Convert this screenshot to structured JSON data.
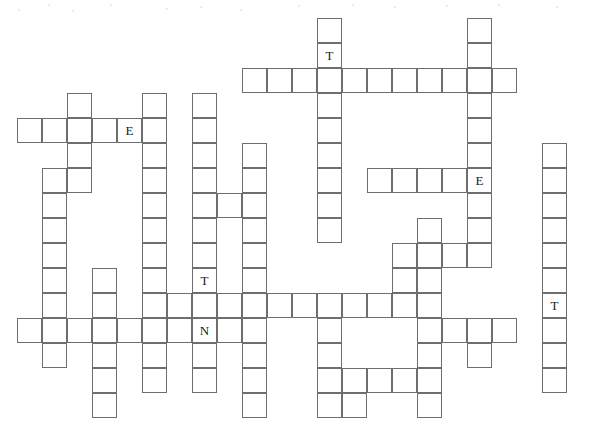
{
  "puzzle": {
    "kind": "crossword-grid",
    "title": "Crossword Puzzle Grid",
    "cell_size": 25,
    "origin_x": 17,
    "origin_y": 18,
    "grid_cols": 23,
    "grid_rows": 17,
    "border_color": "#6e6e6e",
    "cell_background": "#ffffff",
    "letter_color": "#1a1a1a",
    "page_background": "#ffffff",
    "letter_count": 5,
    "cell_count": 139,
    "given_letters": [
      {
        "row": 1,
        "col": 12,
        "letter": "T"
      },
      {
        "row": 4,
        "col": 4,
        "letter": "E"
      },
      {
        "row": 6,
        "col": 18,
        "letter": "E"
      },
      {
        "row": 10,
        "col": 7,
        "letter": "T"
      },
      {
        "row": 11,
        "col": 21,
        "letter": "T"
      },
      {
        "row": 12,
        "col": 7,
        "letter": "N"
      }
    ],
    "entries": [
      {
        "name": "across-1",
        "row": 2,
        "col": 9,
        "length": 11,
        "direction": "across"
      },
      {
        "name": "across-2",
        "row": 4,
        "col": 0,
        "length": 5,
        "direction": "across"
      },
      {
        "name": "across-3",
        "row": 6,
        "col": 14,
        "length": 5,
        "direction": "across"
      },
      {
        "name": "across-4",
        "row": 7,
        "col": 7,
        "length": 3,
        "direction": "across"
      },
      {
        "name": "across-5",
        "row": 9,
        "col": 15,
        "length": 4,
        "direction": "across"
      },
      {
        "name": "across-6",
        "row": 10,
        "col": 15,
        "length": 1,
        "direction": "across"
      },
      {
        "name": "across-7",
        "row": 11,
        "col": 5,
        "length": 12,
        "direction": "across"
      },
      {
        "name": "across-8",
        "row": 12,
        "col": 0,
        "length": 10,
        "direction": "across"
      },
      {
        "name": "across-9",
        "row": 12,
        "col": 16,
        "length": 4,
        "direction": "across"
      },
      {
        "name": "across-10",
        "row": 14,
        "col": 13,
        "length": 4,
        "direction": "across"
      },
      {
        "name": "down-1",
        "row": 0,
        "col": 12,
        "length": 9,
        "direction": "down"
      },
      {
        "name": "down-2",
        "row": 0,
        "col": 18,
        "length": 9,
        "direction": "down"
      },
      {
        "name": "down-3",
        "row": 3,
        "col": 2,
        "length": 5,
        "direction": "down"
      },
      {
        "name": "down-4",
        "row": 3,
        "col": 5,
        "length": 10,
        "direction": "down"
      },
      {
        "name": "down-5",
        "row": 3,
        "col": 7,
        "length": 11,
        "direction": "down"
      },
      {
        "name": "down-6",
        "row": 5,
        "col": 21,
        "length": 9,
        "direction": "down"
      },
      {
        "name": "down-7",
        "row": 5,
        "col": 9,
        "length": 10,
        "direction": "down"
      },
      {
        "name": "down-8",
        "row": 6,
        "col": 1,
        "length": 9,
        "direction": "down"
      },
      {
        "name": "down-9",
        "row": 8,
        "col": 16,
        "length": 8,
        "direction": "down"
      },
      {
        "name": "down-10",
        "row": 11,
        "col": 3,
        "length": 5,
        "direction": "down"
      }
    ],
    "cells": [
      [
        0,
        12
      ],
      [
        0,
        18
      ],
      [
        1,
        12
      ],
      [
        1,
        18
      ],
      [
        2,
        9
      ],
      [
        2,
        10
      ],
      [
        2,
        11
      ],
      [
        2,
        12
      ],
      [
        2,
        13
      ],
      [
        2,
        14
      ],
      [
        2,
        15
      ],
      [
        2,
        16
      ],
      [
        2,
        17
      ],
      [
        2,
        18
      ],
      [
        2,
        19
      ],
      [
        3,
        2
      ],
      [
        3,
        5
      ],
      [
        3,
        7
      ],
      [
        3,
        12
      ],
      [
        3,
        18
      ],
      [
        4,
        0
      ],
      [
        4,
        1
      ],
      [
        4,
        2
      ],
      [
        4,
        3
      ],
      [
        4,
        4
      ],
      [
        4,
        5
      ],
      [
        4,
        7
      ],
      [
        4,
        12
      ],
      [
        4,
        18
      ],
      [
        5,
        2
      ],
      [
        5,
        5
      ],
      [
        5,
        7
      ],
      [
        5,
        9
      ],
      [
        5,
        12
      ],
      [
        5,
        18
      ],
      [
        5,
        21
      ],
      [
        6,
        1
      ],
      [
        6,
        2
      ],
      [
        6,
        5
      ],
      [
        6,
        7
      ],
      [
        6,
        9
      ],
      [
        6,
        12
      ],
      [
        6,
        14
      ],
      [
        6,
        15
      ],
      [
        6,
        16
      ],
      [
        6,
        17
      ],
      [
        6,
        18
      ],
      [
        6,
        21
      ],
      [
        7,
        1
      ],
      [
        7,
        5
      ],
      [
        7,
        7
      ],
      [
        7,
        8
      ],
      [
        7,
        9
      ],
      [
        7,
        12
      ],
      [
        7,
        18
      ],
      [
        7,
        21
      ],
      [
        8,
        1
      ],
      [
        8,
        5
      ],
      [
        8,
        7
      ],
      [
        8,
        9
      ],
      [
        8,
        12
      ],
      [
        8,
        16
      ],
      [
        8,
        18
      ],
      [
        8,
        21
      ],
      [
        9,
        1
      ],
      [
        9,
        5
      ],
      [
        9,
        7
      ],
      [
        9,
        9
      ],
      [
        9,
        15
      ],
      [
        9,
        16
      ],
      [
        9,
        17
      ],
      [
        9,
        18
      ],
      [
        9,
        21
      ],
      [
        10,
        1
      ],
      [
        10,
        3
      ],
      [
        10,
        5
      ],
      [
        10,
        7
      ],
      [
        10,
        9
      ],
      [
        10,
        15
      ],
      [
        10,
        16
      ],
      [
        10,
        21
      ],
      [
        11,
        1
      ],
      [
        11,
        3
      ],
      [
        11,
        5
      ],
      [
        11,
        6
      ],
      [
        11,
        7
      ],
      [
        11,
        8
      ],
      [
        11,
        9
      ],
      [
        11,
        10
      ],
      [
        11,
        11
      ],
      [
        11,
        12
      ],
      [
        11,
        13
      ],
      [
        11,
        14
      ],
      [
        11,
        15
      ],
      [
        11,
        16
      ],
      [
        11,
        21
      ],
      [
        12,
        0
      ],
      [
        12,
        1
      ],
      [
        12,
        2
      ],
      [
        12,
        3
      ],
      [
        12,
        4
      ],
      [
        12,
        5
      ],
      [
        12,
        6
      ],
      [
        12,
        7
      ],
      [
        12,
        8
      ],
      [
        12,
        9
      ],
      [
        12,
        12
      ],
      [
        12,
        16
      ],
      [
        12,
        17
      ],
      [
        12,
        18
      ],
      [
        12,
        19
      ],
      [
        12,
        21
      ],
      [
        13,
        1
      ],
      [
        13,
        3
      ],
      [
        13,
        5
      ],
      [
        13,
        7
      ],
      [
        13,
        9
      ],
      [
        13,
        12
      ],
      [
        13,
        16
      ],
      [
        13,
        18
      ],
      [
        13,
        21
      ],
      [
        14,
        3
      ],
      [
        14,
        5
      ],
      [
        14,
        7
      ],
      [
        14,
        9
      ],
      [
        14,
        12
      ],
      [
        14,
        13
      ],
      [
        14,
        14
      ],
      [
        14,
        15
      ],
      [
        14,
        16
      ],
      [
        14,
        21
      ],
      [
        15,
        3
      ],
      [
        15,
        9
      ],
      [
        15,
        12
      ],
      [
        15,
        13
      ],
      [
        15,
        16
      ]
    ],
    "specks": [
      [
        48,
        4
      ],
      [
        110,
        4
      ],
      [
        200,
        6
      ],
      [
        298,
        5
      ],
      [
        352,
        4
      ],
      [
        394,
        6
      ],
      [
        446,
        5
      ],
      [
        498,
        4
      ],
      [
        556,
        6
      ],
      [
        18,
        9
      ],
      [
        72,
        10
      ],
      [
        166,
        8
      ],
      [
        240,
        9
      ]
    ]
  }
}
